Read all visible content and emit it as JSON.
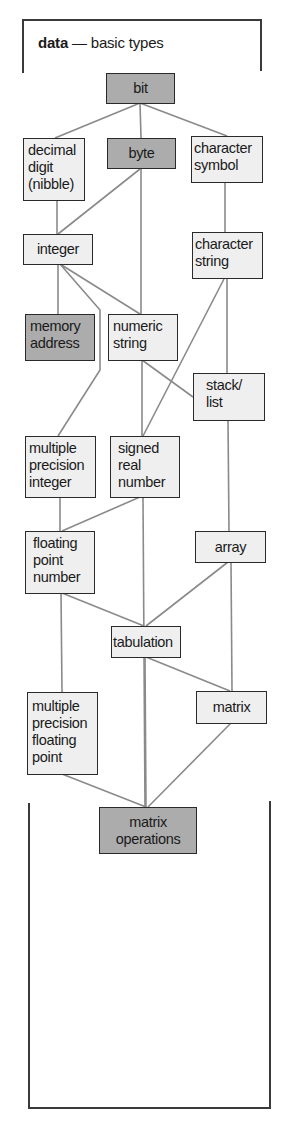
{
  "title": {
    "bold": "data",
    "rest": " — basic types"
  },
  "colors": {
    "primary_node_fill": "#acacac",
    "node_fill": "#efefef",
    "border": "#2a2a2a",
    "connector": "#8a8a8a"
  },
  "nodes": {
    "bit": {
      "label": "bit",
      "shaded": true
    },
    "decimal_digit": {
      "lines": [
        "decimal",
        "digit",
        "(nibble)"
      ],
      "shaded": false
    },
    "byte": {
      "label": "byte",
      "shaded": true
    },
    "character_symbol": {
      "lines": [
        "character",
        "symbol"
      ],
      "shaded": false
    },
    "integer": {
      "label": "integer",
      "shaded": false
    },
    "character_string": {
      "lines": [
        "character",
        "string"
      ],
      "shaded": false
    },
    "memory_address": {
      "lines": [
        "memory",
        "address"
      ],
      "shaded": true
    },
    "numeric_string": {
      "lines": [
        "numeric",
        "string"
      ],
      "shaded": false
    },
    "stack_list": {
      "lines": [
        "stack/",
        "list"
      ],
      "shaded": false
    },
    "multiple_precision_integer": {
      "lines": [
        "multiple",
        "precision",
        "integer"
      ],
      "shaded": false
    },
    "signed_real_number": {
      "lines": [
        "signed",
        "real",
        "number"
      ],
      "shaded": false
    },
    "floating_point_number": {
      "lines": [
        "floating",
        "point",
        "number"
      ],
      "shaded": false
    },
    "array": {
      "label": "array",
      "shaded": false
    },
    "tabulation": {
      "label": "tabulation",
      "shaded": false
    },
    "multiple_precision_floating_point": {
      "lines": [
        "multiple",
        "precision",
        "floating",
        "point"
      ],
      "shaded": false
    },
    "matrix": {
      "label": "matrix",
      "shaded": false
    },
    "matrix_operations": {
      "lines": [
        "matrix",
        "operations"
      ],
      "shaded": true
    }
  },
  "edges": [
    [
      "bit",
      "decimal_digit"
    ],
    [
      "bit",
      "byte"
    ],
    [
      "bit",
      "character_symbol"
    ],
    [
      "decimal_digit",
      "integer"
    ],
    [
      "byte",
      "integer"
    ],
    [
      "byte",
      "numeric_string"
    ],
    [
      "character_symbol",
      "character_string"
    ],
    [
      "integer",
      "memory_address"
    ],
    [
      "integer",
      "numeric_string"
    ],
    [
      "integer",
      "multiple_precision_integer"
    ],
    [
      "numeric_string",
      "signed_real_number"
    ],
    [
      "numeric_string",
      "stack_list"
    ],
    [
      "character_string",
      "stack_list"
    ],
    [
      "character_string",
      "signed_real_number"
    ],
    [
      "stack_list",
      "array"
    ],
    [
      "multiple_precision_integer",
      "floating_point_number"
    ],
    [
      "signed_real_number",
      "floating_point_number"
    ],
    [
      "signed_real_number",
      "matrix_operations"
    ],
    [
      "floating_point_number",
      "tabulation"
    ],
    [
      "floating_point_number",
      "multiple_precision_floating_point"
    ],
    [
      "array",
      "tabulation"
    ],
    [
      "array",
      "matrix"
    ],
    [
      "tabulation",
      "matrix"
    ],
    [
      "tabulation",
      "matrix_operations"
    ],
    [
      "multiple_precision_floating_point",
      "matrix_operations"
    ],
    [
      "matrix",
      "matrix_operations"
    ]
  ]
}
